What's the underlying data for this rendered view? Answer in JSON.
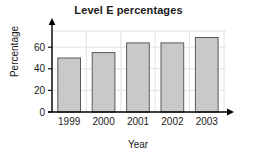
{
  "chart_data": {
    "type": "bar",
    "title": "Level E percentages",
    "xlabel": "Year",
    "ylabel": "Percentage",
    "categories": [
      "1999",
      "2000",
      "2001",
      "2002",
      "2003"
    ],
    "values": [
      50,
      55,
      64,
      64,
      69
    ],
    "ylim": [
      0,
      75
    ],
    "yticks": [
      0,
      20,
      40,
      60
    ],
    "ytick_labels": [
      "0",
      "20",
      "40",
      "60"
    ],
    "grid": true,
    "legend": "none",
    "bar_fill_color": "#c9c9c9",
    "bar_border_color": "#5a5a5a",
    "axis_color": "#000000",
    "grid_color": "#e2e2e2",
    "text_color": "#1a1a1a"
  }
}
